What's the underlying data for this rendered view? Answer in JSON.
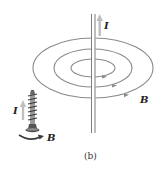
{
  "figure": {
    "caption": "(b)",
    "current_label": "I",
    "field_label": "B",
    "screw_current_label": "I",
    "screw_field_label": "B"
  },
  "colors": {
    "field_lines": "#7a7a7a",
    "wire": "#6e6e6e",
    "current_arrow": "#b8b8b8",
    "text": "#222222"
  }
}
